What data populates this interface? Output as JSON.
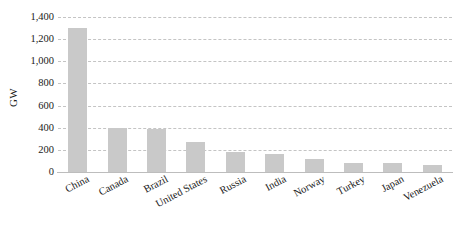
{
  "chart_data": {
    "type": "bar",
    "title": "",
    "xlabel": "",
    "ylabel": "GW",
    "ylim": [
      0,
      1400
    ],
    "ytick_values": [
      1400,
      1200,
      1000,
      800,
      600,
      400,
      200,
      0
    ],
    "ytick_labels": [
      "1,400",
      "1,200",
      "1,000",
      "800",
      "600",
      "400",
      "200",
      "0"
    ],
    "grid": true,
    "legend": false,
    "bar_color": "#c9c9c9",
    "gridline_color": "#c4c4c4",
    "axis_color": "#bdbdbd",
    "categories": [
      "China",
      "Canada",
      "Brazil",
      "United States",
      "Russia",
      "India",
      "Norway",
      "Turkey",
      "Japan",
      "Venezuela"
    ],
    "values": [
      1300,
      400,
      385,
      270,
      185,
      160,
      120,
      80,
      80,
      65
    ]
  }
}
